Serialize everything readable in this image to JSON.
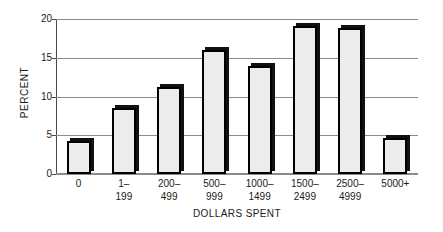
{
  "chart_data": {
    "type": "bar",
    "title": "",
    "xlabel": "DOLLARS SPENT",
    "ylabel": "PERCENT",
    "categories": [
      "0",
      "1–199",
      "200–499",
      "500–999",
      "1000–1499",
      "1500–2499",
      "2500–4999",
      "5000+"
    ],
    "category_lines": [
      [
        "0",
        ""
      ],
      [
        "1–",
        "199"
      ],
      [
        "200–",
        "499"
      ],
      [
        "500–",
        "999"
      ],
      [
        "1000–",
        "1499"
      ],
      [
        "1500–",
        "2499"
      ],
      [
        "2500–",
        "4999"
      ],
      [
        "5000+",
        ""
      ]
    ],
    "values": [
      4.2,
      8.5,
      11.2,
      16.0,
      13.9,
      19.1,
      18.8,
      4.7
    ],
    "ylim": [
      0,
      20
    ],
    "yticks": [
      0,
      5,
      10,
      15,
      20
    ],
    "ytick_labels": [
      "0",
      "5",
      "10",
      "15",
      "20"
    ],
    "grid": true,
    "legend": false,
    "colors": {
      "bar_fill": "#ececec",
      "bar_edge": "#000000",
      "bar_shadow": "#111111",
      "gridline": "#8b8b8b",
      "axis": "#4a4a4a",
      "text": "#1a1a1a",
      "background": "#ffffff"
    }
  }
}
